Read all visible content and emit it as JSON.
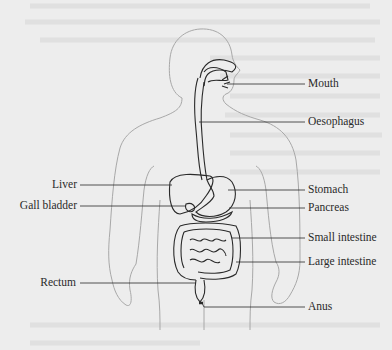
{
  "diagram": {
    "labels": {
      "mouth": "Mouth",
      "oesophagus": "Oesophagus",
      "liver": "Liver",
      "gall_bladder": "Gall bladder",
      "stomach": "Stomach",
      "pancreas": "Pancreas",
      "small_intestine": "Small intestine",
      "large_intestine": "Large intestine",
      "rectum": "Rectum",
      "anus": "Anus"
    },
    "colors": {
      "paper": "#ededed",
      "outline": "#a8a8a8",
      "organ_stroke": "#2a2a2a",
      "text": "#2a2a2a"
    }
  }
}
